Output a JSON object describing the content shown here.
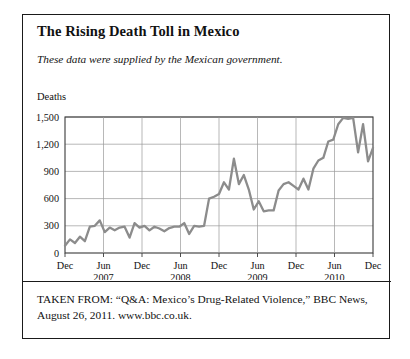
{
  "figure": {
    "title": "The Rising Death Toll in Mexico",
    "subtitle": "These data were supplied by the Mexican government.",
    "axis_title": "Deaths",
    "caption": "TAKEN FROM: “Q&A: Mexico’s Drug-Related Violence,” BBC News, August 26, 2011. www.bbc.co.uk.",
    "border_color": "#1a1a1a",
    "background": "#ffffff",
    "line_color": "#8c8c8c",
    "grid_color": "#9a9a9a",
    "text_color": "#111111"
  },
  "chart_data": {
    "type": "line",
    "title": "The Rising Death Toll in Mexico",
    "subtitle": "These data were supplied by the Mexican government.",
    "xlabel": "",
    "ylabel": "Deaths",
    "ylim": [
      0,
      1500
    ],
    "yticks": [
      0,
      300,
      600,
      900,
      1200,
      1500
    ],
    "ytick_labels": [
      "0",
      "300",
      "600",
      "900",
      "1,200",
      "1,500"
    ],
    "grid": true,
    "legend": null,
    "xtick_labels": [
      "Dec",
      "Jun",
      "Dec",
      "Jun",
      "Dec",
      "Jun",
      "Dec",
      "Jun",
      "Dec"
    ],
    "xtick_sublabels": [
      "",
      "2007",
      "",
      "2008",
      "",
      "2009",
      "",
      "2010",
      ""
    ],
    "series": [
      {
        "name": "Monthly drug-related deaths in Mexico",
        "color": "#8c8c8c",
        "x_start": "Dec 2006",
        "x_end": "Dec 2010",
        "x_step_months": 1,
        "values": [
          80,
          150,
          110,
          180,
          130,
          290,
          300,
          360,
          230,
          280,
          250,
          280,
          290,
          170,
          330,
          280,
          300,
          250,
          290,
          270,
          240,
          275,
          290,
          290,
          330,
          210,
          300,
          290,
          300,
          600,
          620,
          650,
          780,
          700,
          1040,
          760,
          860,
          700,
          480,
          570,
          460,
          470,
          470,
          690,
          760,
          780,
          740,
          700,
          820,
          700,
          930,
          1020,
          1050,
          1230,
          1250,
          1420,
          1490,
          1480,
          1490,
          1110,
          1420,
          1010,
          1160
        ]
      }
    ]
  }
}
